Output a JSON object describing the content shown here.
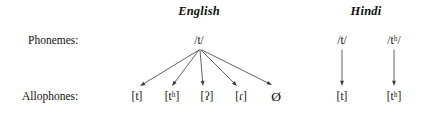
{
  "figure": {
    "background_color": "#ffffff",
    "line_color": "#3a3a3a",
    "text_color": "#111111",
    "width": 430,
    "height": 122
  },
  "row_labels": {
    "phonemes": "Phonemes:",
    "allophones": "Allophones:"
  },
  "languages": [
    {
      "name": "English",
      "header_x": 199,
      "header_y": 11,
      "phoneme_nodes": [
        {
          "id": "eng-phoneme-t",
          "text": "/t/",
          "x": 199,
          "y": 40
        }
      ],
      "allophone_nodes": [
        {
          "id": "eng-allophone-t",
          "text": "[t]",
          "base": "[t",
          "sup": "",
          "tail": "]",
          "x": 137,
          "y": 96
        },
        {
          "id": "eng-allophone-th",
          "text": "[tʰ]",
          "base": "[t",
          "sup": "h",
          "tail": "]",
          "x": 172,
          "y": 96
        },
        {
          "id": "eng-allophone-glottal",
          "text": "[ʔ]",
          "base": "[ʔ",
          "sup": "",
          "tail": "]",
          "x": 207,
          "y": 96
        },
        {
          "id": "eng-allophone-flap",
          "text": "[ɾ]",
          "base": "[ɾ",
          "sup": "",
          "tail": "]",
          "x": 241,
          "y": 96
        },
        {
          "id": "eng-allophone-null",
          "text": "Ø",
          "base": "Ø",
          "sup": "",
          "tail": "",
          "x": 276,
          "y": 96
        }
      ]
    },
    {
      "name": "Hindi",
      "header_x": 366,
      "header_y": 11,
      "phoneme_nodes": [
        {
          "id": "hin-phoneme-t",
          "text": "/t/",
          "base": "/t",
          "sup": "",
          "tail": "/",
          "x": 342,
          "y": 40
        },
        {
          "id": "hin-phoneme-th",
          "text": "/tʰ/",
          "base": "/t",
          "sup": "h",
          "tail": "/",
          "x": 394,
          "y": 40
        }
      ],
      "allophone_nodes": [
        {
          "id": "hin-allophone-t",
          "text": "[t]",
          "base": "[t",
          "sup": "",
          "tail": "]",
          "x": 342,
          "y": 96
        },
        {
          "id": "hin-allophone-th",
          "text": "[tʰ]",
          "base": "[t",
          "sup": "h",
          "tail": "]",
          "x": 394,
          "y": 96
        }
      ]
    }
  ],
  "arrows": [
    {
      "id": "arrow-eng-t-to-t",
      "from": "eng-phoneme-t",
      "to": "eng-allophone-t",
      "x1": 199,
      "y1": 50,
      "x2": 140,
      "y2": 86
    },
    {
      "id": "arrow-eng-t-to-th",
      "from": "eng-phoneme-t",
      "to": "eng-allophone-th",
      "x1": 199,
      "y1": 50,
      "x2": 172,
      "y2": 86
    },
    {
      "id": "arrow-eng-t-to-glottal",
      "from": "eng-phoneme-t",
      "to": "eng-allophone-glottal",
      "x1": 200,
      "y1": 50,
      "x2": 203,
      "y2": 86
    },
    {
      "id": "arrow-eng-t-to-flap",
      "from": "eng-phoneme-t",
      "to": "eng-allophone-flap",
      "x1": 201,
      "y1": 50,
      "x2": 237,
      "y2": 86
    },
    {
      "id": "arrow-eng-t-to-null",
      "from": "eng-phoneme-t",
      "to": "eng-allophone-null",
      "x1": 202,
      "y1": 50,
      "x2": 272,
      "y2": 85
    },
    {
      "id": "arrow-hin-t-to-t",
      "from": "hin-phoneme-t",
      "to": "hin-allophone-t",
      "x1": 342,
      "y1": 50,
      "x2": 342,
      "y2": 86
    },
    {
      "id": "arrow-hin-th-to-th",
      "from": "hin-phoneme-th",
      "to": "hin-allophone-th",
      "x1": 394,
      "y1": 50,
      "x2": 394,
      "y2": 86
    }
  ]
}
